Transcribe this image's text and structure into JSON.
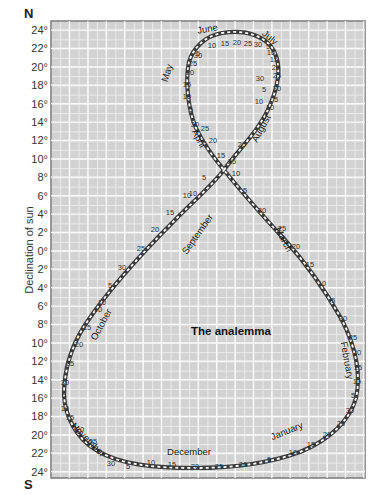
{
  "title": "The analemma",
  "axis": {
    "ylabel": "Declination of sun",
    "north_label": "N",
    "south_label": "S",
    "ticks": [
      "24°",
      "22°",
      "20°",
      "18°",
      "16°",
      "14°",
      "12°",
      "10°",
      "8°",
      "6°",
      "4°",
      "2°",
      "0°",
      "2°",
      "4°",
      "6°",
      "8°",
      "10°",
      "12°",
      "14°",
      "16°",
      "18°",
      "20°",
      "22°",
      "24°"
    ]
  },
  "months": [
    {
      "name": "June",
      "x": 208,
      "y": 32,
      "rot": -10
    },
    {
      "name": "July",
      "x": 268,
      "y": 40,
      "rot": 40
    },
    {
      "name": "May",
      "x": 170,
      "y": 74,
      "rot": -72
    },
    {
      "name": "August",
      "x": 264,
      "y": 130,
      "rot": -62
    },
    {
      "name": "April",
      "x": 196,
      "y": 140,
      "rot": 62
    },
    {
      "name": "September",
      "x": 200,
      "y": 236,
      "rot": -55
    },
    {
      "name": "March",
      "x": 281,
      "y": 241,
      "rot": 62
    },
    {
      "name": "October",
      "x": 104,
      "y": 326,
      "rot": -62
    },
    {
      "name": "February",
      "x": 344,
      "y": 361,
      "rot": 80
    },
    {
      "name": "November",
      "x": 86,
      "y": 442,
      "rot": 45
    },
    {
      "name": "December",
      "x": 189,
      "y": 455,
      "rot": 0
    },
    {
      "name": "January",
      "x": 288,
      "y": 434,
      "rot": -22
    }
  ],
  "day_labels": [
    {
      "t": "5",
      "x": 198,
      "y": 56
    },
    {
      "t": "10",
      "x": 212,
      "y": 48
    },
    {
      "t": "15",
      "x": 225,
      "y": 46
    },
    {
      "t": "20",
      "x": 237,
      "y": 45
    },
    {
      "t": "25",
      "x": 248,
      "y": 46
    },
    {
      "t": "30",
      "x": 258,
      "y": 47
    },
    {
      "t": "30",
      "x": 198,
      "y": 58
    },
    {
      "t": "25",
      "x": 193,
      "y": 66
    },
    {
      "t": "20",
      "x": 190,
      "y": 75
    },
    {
      "t": "15",
      "x": 187,
      "y": 87
    },
    {
      "t": "10",
      "x": 187,
      "y": 99
    },
    {
      "t": "5",
      "x": 191,
      "y": 112
    },
    {
      "t": "30",
      "x": 195,
      "y": 127
    },
    {
      "t": "5",
      "x": 268,
      "y": 49
    },
    {
      "t": "10",
      "x": 271,
      "y": 55
    },
    {
      "t": "15",
      "x": 274,
      "y": 62
    },
    {
      "t": "20",
      "x": 276,
      "y": 70
    },
    {
      "t": "25",
      "x": 277,
      "y": 78
    },
    {
      "t": "30",
      "x": 277,
      "y": 91
    },
    {
      "t": "5",
      "x": 276,
      "y": 102
    },
    {
      "t": "10",
      "x": 270,
      "y": 110
    },
    {
      "t": "30",
      "x": 260,
      "y": 81
    },
    {
      "t": "5",
      "x": 264,
      "y": 92
    },
    {
      "t": "10",
      "x": 259,
      "y": 104
    },
    {
      "t": "25",
      "x": 205,
      "y": 131
    },
    {
      "t": "20",
      "x": 213,
      "y": 143
    },
    {
      "t": "15",
      "x": 221,
      "y": 158
    },
    {
      "t": "10",
      "x": 236,
      "y": 176
    },
    {
      "t": "5",
      "x": 245,
      "y": 193
    },
    {
      "t": "20",
      "x": 242,
      "y": 147
    },
    {
      "t": "25",
      "x": 232,
      "y": 164
    },
    {
      "t": "5",
      "x": 204,
      "y": 180
    },
    {
      "t": "10",
      "x": 187,
      "y": 198
    },
    {
      "t": "30",
      "x": 262,
      "y": 213
    },
    {
      "t": "25",
      "x": 282,
      "y": 231
    },
    {
      "t": "20",
      "x": 296,
      "y": 249
    },
    {
      "t": "15",
      "x": 310,
      "y": 267
    },
    {
      "t": "10",
      "x": 322,
      "y": 286
    },
    {
      "t": "5",
      "x": 333,
      "y": 303
    },
    {
      "t": "10",
      "x": 193,
      "y": 196
    },
    {
      "t": "15",
      "x": 170,
      "y": 215
    },
    {
      "t": "20",
      "x": 155,
      "y": 232
    },
    {
      "t": "25",
      "x": 141,
      "y": 251
    },
    {
      "t": "30",
      "x": 122,
      "y": 270
    },
    {
      "t": "5",
      "x": 110,
      "y": 288
    },
    {
      "t": "10",
      "x": 102,
      "y": 305
    },
    {
      "t": "10",
      "x": 98,
      "y": 312
    },
    {
      "t": "15",
      "x": 87,
      "y": 330
    },
    {
      "t": "20",
      "x": 79,
      "y": 347
    },
    {
      "t": "25",
      "x": 70,
      "y": 366
    },
    {
      "t": "30",
      "x": 65,
      "y": 385
    },
    {
      "t": "5",
      "x": 64,
      "y": 398
    },
    {
      "t": "10",
      "x": 65,
      "y": 411
    },
    {
      "t": "15",
      "x": 70,
      "y": 420
    },
    {
      "t": "20",
      "x": 80,
      "y": 432
    },
    {
      "t": "25",
      "x": 93,
      "y": 444
    },
    {
      "t": "30",
      "x": 111,
      "y": 466
    },
    {
      "t": "5",
      "x": 128,
      "y": 469
    },
    {
      "t": "10",
      "x": 151,
      "y": 465
    },
    {
      "t": "15",
      "x": 172,
      "y": 467
    },
    {
      "t": "20",
      "x": 195,
      "y": 469
    },
    {
      "t": "25",
      "x": 219,
      "y": 469
    },
    {
      "t": "30",
      "x": 243,
      "y": 467
    },
    {
      "t": "5",
      "x": 269,
      "y": 462
    },
    {
      "t": "10",
      "x": 293,
      "y": 455
    },
    {
      "t": "15",
      "x": 311,
      "y": 447
    },
    {
      "t": "20",
      "x": 327,
      "y": 437
    },
    {
      "t": "25",
      "x": 341,
      "y": 426
    },
    {
      "t": "30",
      "x": 350,
      "y": 413
    },
    {
      "t": "5",
      "x": 353,
      "y": 398
    },
    {
      "t": "10",
      "x": 357,
      "y": 384
    },
    {
      "t": "15",
      "x": 358,
      "y": 370
    },
    {
      "t": "20",
      "x": 357,
      "y": 355
    },
    {
      "t": "25",
      "x": 353,
      "y": 340
    },
    {
      "t": "30",
      "x": 343,
      "y": 321
    }
  ],
  "colors": {
    "grid_bg": "#d2d2d2",
    "grid_line": "#f2f2f2",
    "frame": "#7a7a7a",
    "curve_dark": "#3a3a3a",
    "curve_light": "#ffffff"
  }
}
